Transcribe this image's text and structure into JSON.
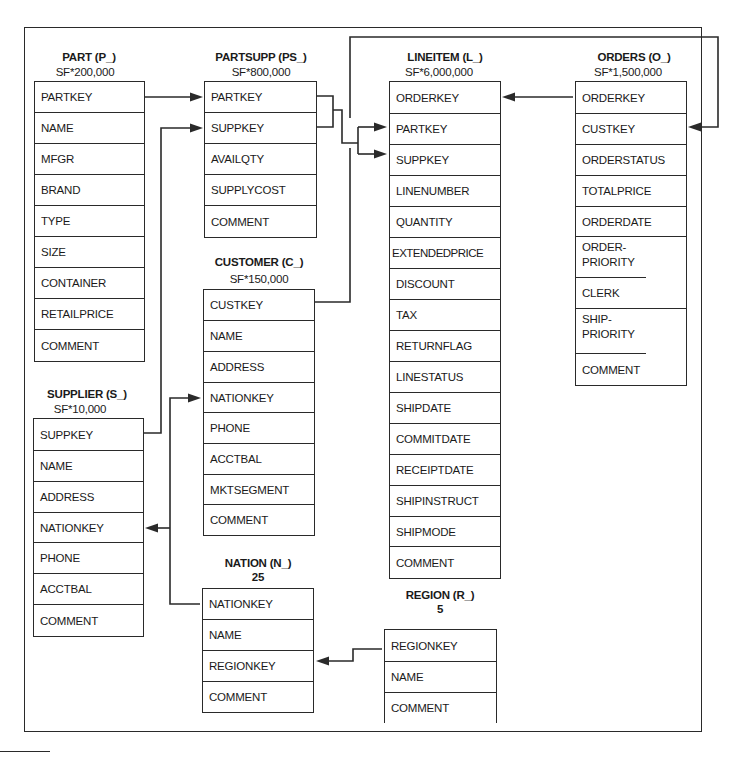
{
  "diagram": {
    "type": "database-schema",
    "tables": {
      "part": {
        "title": "PART (P_)",
        "cardinality": "SF*200,000",
        "columns": [
          "PARTKEY",
          "NAME",
          "MFGR",
          "BRAND",
          "TYPE",
          "SIZE",
          "CONTAINER",
          "RETAILPRICE",
          "COMMENT"
        ]
      },
      "partsupp": {
        "title": "PARTSUPP (PS_)",
        "cardinality": "SF*800,000",
        "columns": [
          "PARTKEY",
          "SUPPKEY",
          "AVAILQTY",
          "SUPPLYCOST",
          "COMMENT"
        ]
      },
      "lineitem": {
        "title": "LINEITEM (L_)",
        "cardinality": "SF*6,000,000",
        "columns": [
          "ORDERKEY",
          "PARTKEY",
          "SUPPKEY",
          "LINENUMBER",
          "QUANTITY",
          "EXTENDEDPRICE",
          "DISCOUNT",
          "TAX",
          "RETURNFLAG",
          "LINESTATUS",
          "SHIPDATE",
          "COMMITDATE",
          "RECEIPTDATE",
          "SHIPINSTRUCT",
          "SHIPMODE",
          "COMMENT"
        ]
      },
      "orders": {
        "title": "ORDERS (O_)",
        "cardinality": "SF*1,500,000",
        "columns": [
          "ORDERKEY",
          "CUSTKEY",
          "ORDERSTATUS",
          "TOTALPRICE",
          "ORDERDATE",
          "ORDER-PRIORITY",
          "CLERK",
          "SHIP-PRIORITY",
          "COMMENT"
        ]
      },
      "customer": {
        "title": "CUSTOMER (C_)",
        "cardinality": "SF*150,000",
        "columns": [
          "CUSTKEY",
          "NAME",
          "ADDRESS",
          "NATIONKEY",
          "PHONE",
          "ACCTBAL",
          "MKTSEGMENT",
          "COMMENT"
        ]
      },
      "supplier": {
        "title": "SUPPLIER (S_)",
        "cardinality": "SF*10,000",
        "columns": [
          "SUPPKEY",
          "NAME",
          "ADDRESS",
          "NATIONKEY",
          "PHONE",
          "ACCTBAL",
          "COMMENT"
        ]
      },
      "nation": {
        "title": "NATION (N_)",
        "cardinality": "25",
        "columns": [
          "NATIONKEY",
          "NAME",
          "REGIONKEY",
          "COMMENT"
        ]
      },
      "region": {
        "title": "REGION (R_)",
        "cardinality": "5",
        "columns": [
          "REGIONKEY",
          "NAME",
          "COMMENT"
        ]
      }
    },
    "relationships": [
      {
        "from": "PART.PARTKEY",
        "to": "PARTSUPP.PARTKEY"
      },
      {
        "from": "SUPPLIER.SUPPKEY",
        "to": "PARTSUPP.SUPPKEY"
      },
      {
        "from": "PARTSUPP.PARTKEY+SUPPKEY",
        "to": "LINEITEM.PARTKEY"
      },
      {
        "from": "PARTSUPP.PARTKEY+SUPPKEY",
        "to": "LINEITEM.SUPPKEY"
      },
      {
        "from": "ORDERS.ORDERKEY",
        "to": "LINEITEM.ORDERKEY"
      },
      {
        "from": "CUSTOMER.CUSTKEY",
        "to": "ORDERS.CUSTKEY"
      },
      {
        "from": "NATION.NATIONKEY",
        "to": "CUSTOMER.NATIONKEY"
      },
      {
        "from": "NATION.NATIONKEY",
        "to": "SUPPLIER.NATIONKEY"
      },
      {
        "from": "REGION.REGIONKEY",
        "to": "NATION.REGIONKEY"
      }
    ]
  }
}
